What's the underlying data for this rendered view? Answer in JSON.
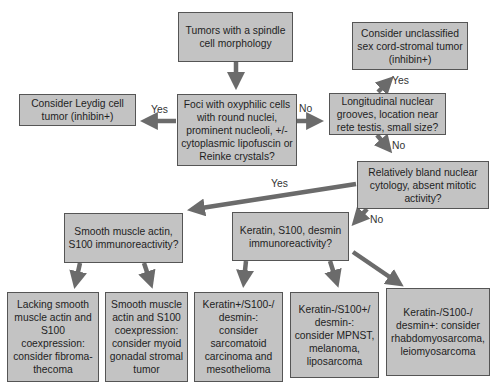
{
  "diagram": {
    "type": "flowchart",
    "colors": {
      "box_fill": "#c3c3c3",
      "box_border": "#555555",
      "arrow": "#6b6b6b"
    },
    "nodes": {
      "root": "Tumors with a spindle cell morphology",
      "foci": "Foci with oxyphilic cells with round nuclei, prominent nucleoli, +/- cytoplasmic lipofuscin or Reinke crystals?",
      "leydig": "Consider Leydig cell tumor (inhibin+)",
      "longitudinal": "Longitudinal nuclear grooves, location near rete testis, small size?",
      "unclassified": "Consider unclassified sex cord-stromal tumor (inhibin+)",
      "bland": "Relatively bland nuclear cytology, absent mitotic activity?",
      "sma": "Smooth muscle actin, S100 immunoreactivity?",
      "keratin": "Keratin, S100, desmin immunoreactivity?",
      "fibroma": "Lacking smooth muscle actin and S100 coexpression: consider fibroma-thecoma",
      "myoid": "Smooth muscle actin and S100 coexpression: consider myoid gonadal stromal tumor",
      "sarcomatoid": "Keratin+/S100-/ desmin-: consider sarcomatoid carcinoma and mesothelioma",
      "mpnst": "Keratin-/S100+/ desmin-: consider MPNST, melanoma, liposarcoma",
      "rhabdo": "Keratin-/S100-/ desmin+: consider rhabdomyosarcoma, leiomyosarcoma"
    },
    "edge_labels": {
      "foci_to_leydig": "Yes",
      "foci_to_longitudinal": "No",
      "longitudinal_to_unclassified": "Yes",
      "longitudinal_to_bland": "No",
      "bland_to_sma": "Yes",
      "bland_to_keratin": "No"
    }
  }
}
